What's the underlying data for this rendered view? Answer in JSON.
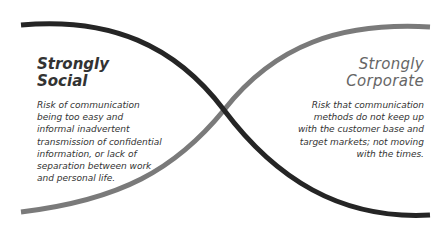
{
  "diagram": {
    "type": "crossing-curves",
    "left_panel": {
      "title_line1": "Strongly",
      "title_line2": "Social",
      "body_lines": [
        "Risk of communication",
        "being too easy and",
        "informal inadvertent",
        "transmission of confidential",
        "information, or lack of",
        "separation between work",
        "and personal life."
      ]
    },
    "right_panel": {
      "title_line1": "Strongly",
      "title_line2": "Corporate",
      "body_lines": [
        "Risk that communication",
        "methods do not keep up",
        "with the customer base and",
        "target markets; not moving",
        "with the times."
      ]
    },
    "colors": {
      "dark_curve": "#252525",
      "light_curve": "#7a7a7a",
      "text": "#333333",
      "corporate_title": "#666666"
    }
  }
}
